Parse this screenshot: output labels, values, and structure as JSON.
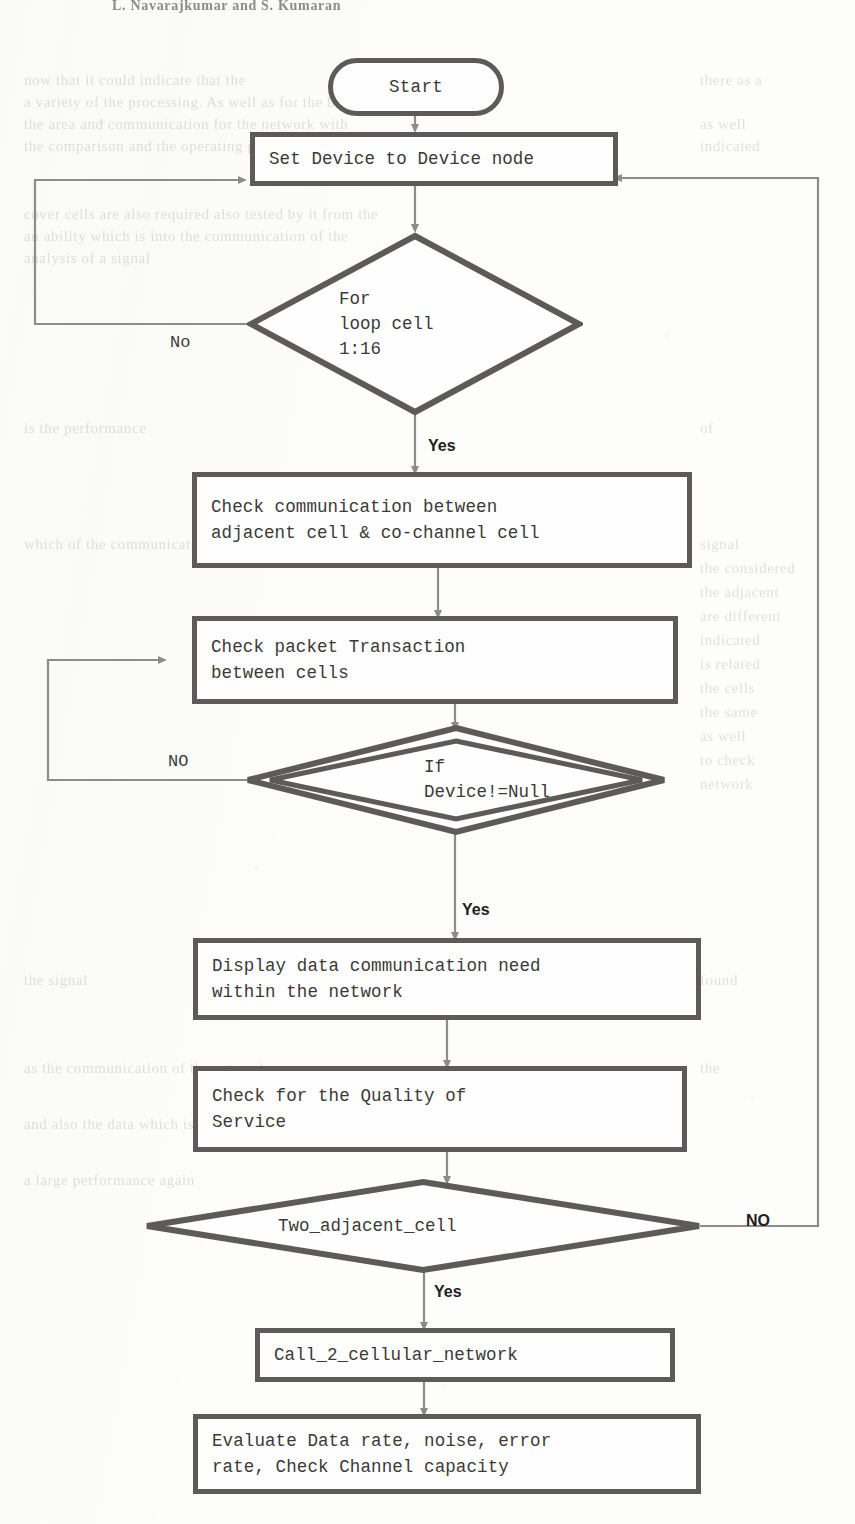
{
  "page": {
    "running_head": "L. Navarajkumar  and  S. Kumaran",
    "width": 855,
    "height": 1524
  },
  "colors": {
    "stroke": "#5d5b58",
    "text": "#3c3a37",
    "connector": "#8e8c88",
    "label": "#23211f",
    "paper": "#fdfdfc"
  },
  "flowchart": {
    "title": "Cellular network communication check flowchart",
    "nodes": [
      {
        "id": "start",
        "type": "terminator",
        "label": "Start"
      },
      {
        "id": "set-device",
        "type": "process",
        "label": "Set Device to Device node"
      },
      {
        "id": "for-loop",
        "type": "decision",
        "label": "For\nloop cell\n1:16"
      },
      {
        "id": "check-comm",
        "type": "process",
        "label": "Check communication between\nadjacent cell & co-channel cell"
      },
      {
        "id": "check-packet",
        "type": "process",
        "label": "Check packet Transaction\nbetween cells"
      },
      {
        "id": "if-device",
        "type": "decision-double",
        "label": "If\nDevice!=Null"
      },
      {
        "id": "display-data",
        "type": "process",
        "label": "Display data communication need\nwithin the network"
      },
      {
        "id": "check-qos",
        "type": "process",
        "label": " Check for the Quality of\nService"
      },
      {
        "id": "two-adjacent",
        "type": "decision",
        "label": "Two_adjacent_cell"
      },
      {
        "id": "call-2",
        "type": "process",
        "label": "Call_2_cellular_network"
      },
      {
        "id": "evaluate",
        "type": "process",
        "label": "Evaluate Data rate, noise, error\nrate, Check Channel capacity"
      }
    ],
    "edge_labels": {
      "for_loop_no": "No",
      "for_loop_yes": "Yes",
      "if_device_no": "NO",
      "if_device_yes": "Yes",
      "two_adjacent_no": "NO",
      "two_adjacent_yes": "Yes"
    }
  },
  "ghost_lines": [
    {
      "x": 24,
      "y": 72,
      "text": "now that it could indicate that the"
    },
    {
      "x": 700,
      "y": 72,
      "text": "there as a"
    },
    {
      "x": 24,
      "y": 94,
      "text": "a variety of the processing. As well as for the bending"
    },
    {
      "x": 24,
      "y": 116,
      "text": "the area and communication for the network with"
    },
    {
      "x": 700,
      "y": 116,
      "text": "as well"
    },
    {
      "x": 24,
      "y": 138,
      "text": "the comparison and the operating performance"
    },
    {
      "x": 700,
      "y": 138,
      "text": "indicated"
    },
    {
      "x": 24,
      "y": 206,
      "text": "cover cells are also required also tested by it from the"
    },
    {
      "x": 24,
      "y": 228,
      "text": "an ability which is into the communication of the"
    },
    {
      "x": 24,
      "y": 250,
      "text": "analysis of a signal"
    },
    {
      "x": 24,
      "y": 420,
      "text": "is the performance"
    },
    {
      "x": 700,
      "y": 420,
      "text": "of"
    },
    {
      "x": 24,
      "y": 536,
      "text": "which of the communication and the data"
    },
    {
      "x": 700,
      "y": 536,
      "text": "signal"
    },
    {
      "x": 700,
      "y": 560,
      "text": "the considered"
    },
    {
      "x": 700,
      "y": 584,
      "text": "the adjacent"
    },
    {
      "x": 700,
      "y": 608,
      "text": "are different"
    },
    {
      "x": 700,
      "y": 632,
      "text": "indicated"
    },
    {
      "x": 700,
      "y": 656,
      "text": "is related"
    },
    {
      "x": 700,
      "y": 680,
      "text": "the cells"
    },
    {
      "x": 700,
      "y": 704,
      "text": "the same"
    },
    {
      "x": 700,
      "y": 728,
      "text": "as well"
    },
    {
      "x": 700,
      "y": 752,
      "text": "to check"
    },
    {
      "x": 700,
      "y": 776,
      "text": "network"
    },
    {
      "x": 24,
      "y": 972,
      "text": "the signal"
    },
    {
      "x": 700,
      "y": 972,
      "text": "found"
    },
    {
      "x": 24,
      "y": 1060,
      "text": "as the communication of the network"
    },
    {
      "x": 700,
      "y": 1060,
      "text": "the"
    },
    {
      "x": 24,
      "y": 1116,
      "text": "and also the data which is for the signal"
    },
    {
      "x": 24,
      "y": 1172,
      "text": "a large performance again"
    }
  ]
}
